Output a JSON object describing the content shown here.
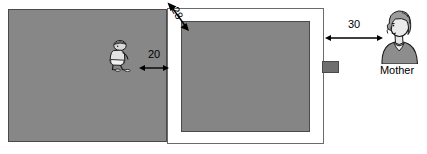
{
  "diagram": {
    "units_implied": "unlabeled numeric distances",
    "left_panel": {
      "name": "left-room-area",
      "fill_color": "#878787"
    },
    "white_frame": {
      "name": "white-bordered-enclosure",
      "fill_color": "#ffffff",
      "inner_fill_color": "#858585"
    },
    "right_tab": {
      "name": "small-dark-tab",
      "fill_color": "#6f6f6f"
    },
    "dimensions": [
      {
        "id": "dim-20",
        "label": "20",
        "orientation": "horizontal",
        "arrowheads": "both",
        "from": "child-figure",
        "to": "white-frame-left-edge"
      },
      {
        "id": "dim-28",
        "label": "28",
        "orientation": "diagonal",
        "arrowheads": "both",
        "from": "white-frame-outer-top-left-corner",
        "to": "inner-gray-top-left-corner"
      },
      {
        "id": "dim-30",
        "label": "30",
        "orientation": "horizontal",
        "arrowheads": "both",
        "from": "white-frame-right-edge",
        "to": "mother-figure"
      }
    ],
    "figures": [
      {
        "id": "child-figure",
        "icon": "crouching-child-icon",
        "label": ""
      },
      {
        "id": "mother-figure",
        "icon": "woman-bust-icon",
        "label": "Mother"
      }
    ]
  }
}
